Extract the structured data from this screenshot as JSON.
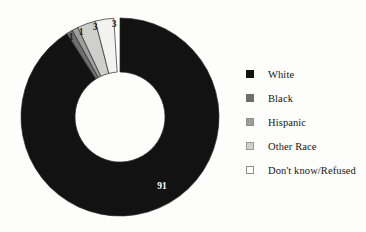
{
  "chart_data": {
    "type": "pie",
    "variant": "donut",
    "title": "",
    "subtitle": "",
    "xlabel": "",
    "ylabel": "",
    "grid": false,
    "legend_position": "right",
    "units": "percent",
    "categories": [
      "White",
      "Black",
      "Hispanic",
      "Other Race",
      "Don't know/Refused"
    ],
    "values": [
      91,
      1,
      1,
      3,
      3
    ],
    "slices": [
      {
        "label": "White",
        "value": 91,
        "data_label": "91",
        "color": "#121212",
        "label_color": "#ffffff",
        "start_angle": 0,
        "end_angle": 327.6,
        "label_x": 162,
        "label_y": 189
      },
      {
        "label": "Black",
        "value": 1,
        "data_label": "1",
        "color": "#6e6e6e",
        "label_color": "#1b1b1b",
        "start_angle": 327.6,
        "end_angle": 331.2,
        "label_x": 71,
        "label_y": 40
      },
      {
        "label": "Hispanic",
        "value": 1,
        "data_label": "1",
        "color": "#9e9e9e",
        "label_color": "#1b1b1b",
        "start_angle": 331.2,
        "end_angle": 334.8,
        "label_x": 81,
        "label_y": 35
      },
      {
        "label": "Other Race",
        "value": 3,
        "data_label": "3",
        "color": "#cfcfcc",
        "label_color": "#1b1b1b",
        "start_angle": 334.8,
        "end_angle": 345.6,
        "label_x": 95,
        "label_y": 30
      },
      {
        "label": "Don't know/Refused",
        "value": 3,
        "data_label": "3",
        "color": "#f2f2ee",
        "label_color": "#1b1b1b",
        "start_angle": 345.6,
        "end_angle": 356.4,
        "label_x": 114,
        "label_y": 27
      }
    ]
  },
  "legend": {
    "items": [
      {
        "label": "White",
        "swatch": "#121212",
        "border": "#121212"
      },
      {
        "label": "Black",
        "swatch": "#6e6e6e",
        "border": "#6e6e6e"
      },
      {
        "label": "Hispanic",
        "swatch": "#9e9e9e",
        "border": "#8f8f8f"
      },
      {
        "label": "Other Race",
        "swatch": "#cfcfcc",
        "border": "#9a9a97"
      },
      {
        "label": "Don't know/Refused",
        "swatch": "#fbfbf8",
        "border": "#8f8f8c"
      }
    ]
  },
  "style": {
    "background": "#fdfdfb",
    "donut_center_x": 120,
    "donut_center_y": 117,
    "donut_outer_radius": 99,
    "donut_inner_radius": 45
  }
}
